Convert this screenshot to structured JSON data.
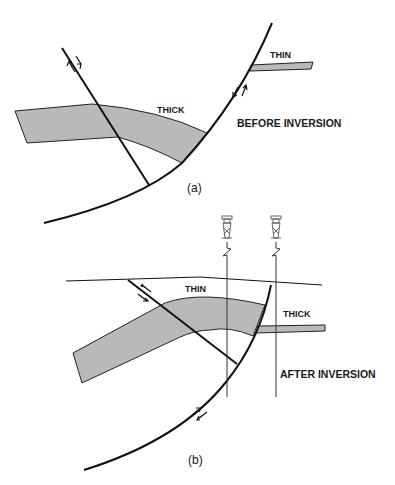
{
  "panel_a": {
    "caption": "(a)",
    "title": "BEFORE INVERSION",
    "labels": {
      "thin": "THIN",
      "thick": "THICK"
    }
  },
  "panel_b": {
    "caption": "(b)",
    "title": "AFTER INVERSION",
    "labels": {
      "thin": "THIN",
      "thick": "THICK"
    },
    "wells": [
      {
        "icon": "drilling-rig-icon"
      },
      {
        "icon": "drilling-rig-icon"
      }
    ]
  },
  "colors": {
    "layer_fill": "#b9b9b9",
    "line": "#111111",
    "background": "#ffffff"
  }
}
